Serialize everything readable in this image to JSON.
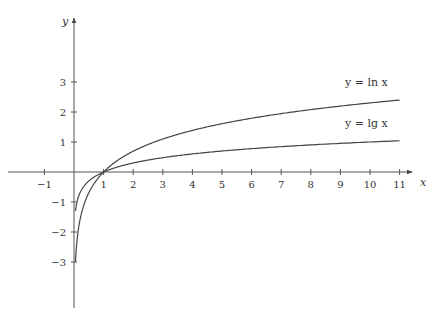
{
  "chart_data": {
    "type": "line",
    "title": "",
    "xlabel": "x",
    "ylabel": "y",
    "xlim": [
      -1.5,
      11.5
    ],
    "ylim": [
      -4.5,
      4.9
    ],
    "grid": false,
    "x_ticks": [
      -1,
      1,
      2,
      3,
      4,
      5,
      6,
      7,
      8,
      9,
      10,
      11
    ],
    "y_ticks": [
      3,
      2,
      1,
      -1,
      -2,
      -3
    ],
    "series": [
      {
        "name": "y = ln x",
        "function": "ln",
        "x_range": [
          0.05,
          11
        ],
        "x": [
          0.05,
          0.1,
          0.25,
          0.5,
          1,
          2,
          3,
          4,
          5,
          6,
          7,
          8,
          9,
          10,
          11
        ],
        "values": [
          -3.0,
          -2.3,
          -1.39,
          -0.69,
          0,
          0.69,
          1.1,
          1.39,
          1.61,
          1.79,
          1.95,
          2.08,
          2.2,
          2.3,
          2.4
        ]
      },
      {
        "name": "y = lg x",
        "function": "log10",
        "x_range": [
          0.05,
          11
        ],
        "x": [
          0.05,
          0.1,
          0.25,
          0.5,
          1,
          2,
          3,
          4,
          5,
          6,
          7,
          8,
          9,
          10,
          11
        ],
        "values": [
          -1.3,
          -1.0,
          -0.6,
          -0.3,
          0,
          0.3,
          0.48,
          0.6,
          0.7,
          0.78,
          0.85,
          0.9,
          0.95,
          1.0,
          1.04
        ]
      }
    ],
    "annotations": [
      {
        "text": "y = ln x",
        "near_x": 9.5,
        "near_y": 3.1
      },
      {
        "text": "y = lg x",
        "near_x": 9.5,
        "near_y": 1.6
      }
    ]
  },
  "labels": {
    "x_axis": "x",
    "y_axis": "y",
    "ln_label": "y = ln x",
    "lg_label": "y = lg x"
  }
}
